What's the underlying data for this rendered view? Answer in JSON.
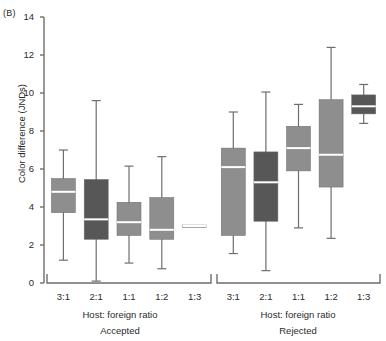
{
  "figure": {
    "panel_tag": "(B)",
    "ylabel": "Color difference (JNDs)",
    "xlabel": "Host: foreign ratio",
    "group_names": [
      "Accepted",
      "Rejected"
    ],
    "colors": {
      "light_gray": "#8e8e8e",
      "dark_gray": "#575757",
      "axis": "#6e6e6e",
      "median": "#ffffff",
      "text": "#2b2b2b",
      "background": "#ffffff"
    }
  },
  "axis": {
    "y_ticks": [
      "0",
      "2",
      "4",
      "6",
      "8",
      "10",
      "12",
      "14"
    ],
    "y_tick_values": [
      0,
      2,
      4,
      6,
      8,
      10,
      12,
      14
    ],
    "y_min": 0,
    "y_max": 14,
    "x_categories": [
      "3:1",
      "2:1",
      "1:1",
      "1:2",
      "1:3"
    ]
  },
  "chart_data": {
    "type": "box",
    "title": "(B)",
    "xlabel": "Host: foreign ratio",
    "ylabel": "Color difference (JNDs)",
    "ylim": [
      0,
      14
    ],
    "ytick_values": [
      0,
      2,
      4,
      6,
      8,
      10,
      12,
      14
    ],
    "grid": false,
    "legend": "none",
    "categories": [
      "3:1",
      "2:1",
      "1:1",
      "1:2",
      "1:3"
    ],
    "panels": [
      {
        "name": "Accepted",
        "xlabel": "Host: foreign ratio",
        "boxes": [
          {
            "category": "3:1",
            "fill": "light_gray",
            "whisker_low": 1.2,
            "q1": 3.7,
            "median": 4.8,
            "q3": 5.5,
            "whisker_high": 7.0
          },
          {
            "category": "2:1",
            "fill": "dark_gray",
            "whisker_low": 0.1,
            "q1": 2.3,
            "median": 3.35,
            "q3": 5.45,
            "whisker_high": 9.6
          },
          {
            "category": "1:1",
            "fill": "light_gray",
            "whisker_low": 1.05,
            "q1": 2.5,
            "median": 3.2,
            "q3": 4.25,
            "whisker_high": 6.15
          },
          {
            "category": "1:2",
            "fill": "light_gray",
            "whisker_low": 0.75,
            "q1": 2.3,
            "median": 2.8,
            "q3": 4.5,
            "whisker_high": 6.65
          },
          {
            "category": "1:3",
            "fill": "light_gray",
            "whisker_low": 3.0,
            "q1": 2.95,
            "median": 3.0,
            "q3": 3.05,
            "whisker_high": 3.0
          }
        ]
      },
      {
        "name": "Rejected",
        "xlabel": "Host: foreign ratio",
        "boxes": [
          {
            "category": "3:1",
            "fill": "light_gray",
            "whisker_low": 1.55,
            "q1": 2.5,
            "median": 6.1,
            "q3": 7.1,
            "whisker_high": 9.0
          },
          {
            "category": "2:1",
            "fill": "dark_gray",
            "whisker_low": 0.65,
            "q1": 3.25,
            "median": 5.3,
            "q3": 6.9,
            "whisker_high": 10.05
          },
          {
            "category": "1:1",
            "fill": "light_gray",
            "whisker_low": 2.9,
            "q1": 5.9,
            "median": 7.1,
            "q3": 8.25,
            "whisker_high": 9.4
          },
          {
            "category": "1:2",
            "fill": "light_gray",
            "whisker_low": 2.35,
            "q1": 5.05,
            "median": 6.75,
            "q3": 9.65,
            "whisker_high": 12.4
          },
          {
            "category": "1:3",
            "fill": "dark_gray",
            "whisker_low": 8.4,
            "q1": 8.9,
            "median": 9.3,
            "q3": 9.9,
            "whisker_high": 10.45
          }
        ]
      }
    ]
  }
}
